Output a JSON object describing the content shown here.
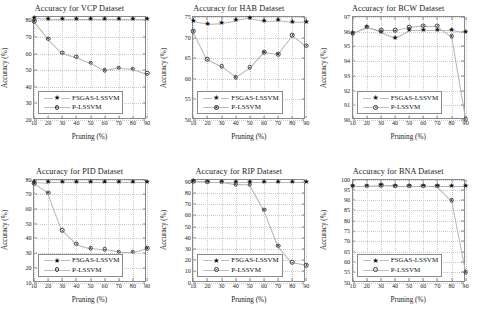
{
  "figure": {
    "series_names": [
      "FSGAS-LSSVM",
      "P-LSSVM"
    ],
    "x_axis_label": "Pruning (%)",
    "y_axis_label": "Accuracy (%)"
  },
  "chart_data": [
    {
      "type": "scatter",
      "title": "Accuracy for VCP Dataset",
      "xlabel": "Pruning (%)",
      "ylabel": "Accuracy (%)",
      "x": [
        10,
        20,
        30,
        40,
        50,
        60,
        70,
        80,
        90
      ],
      "xlim": [
        10,
        90
      ],
      "ylim": [
        20,
        82
      ],
      "xticks": [
        10,
        20,
        30,
        40,
        50,
        60,
        70,
        80,
        90
      ],
      "yticks": [
        20,
        30,
        40,
        50,
        60,
        70,
        80
      ],
      "grid": true,
      "legend_position": "lower-left",
      "series": [
        {
          "name": "FSGAS-LSSVM",
          "marker": "star",
          "values": [
            81.5,
            81.0,
            81.0,
            81.0,
            81.0,
            81.0,
            81.0,
            81.0,
            81.0
          ]
        },
        {
          "name": "P-LSSVM",
          "marker": "circle-dot",
          "values": [
            79.5,
            69.0,
            60.5,
            58.0,
            54.5,
            50.0,
            51.5,
            51.0,
            48.0
          ]
        }
      ]
    },
    {
      "type": "scatter",
      "title": "Accuracy for HAB Dataset",
      "xlabel": "Pruning (%)",
      "ylabel": "Accuracy (%)",
      "x": [
        10,
        20,
        30,
        40,
        50,
        60,
        70,
        80,
        90
      ],
      "xlim": [
        10,
        90
      ],
      "ylim": [
        50,
        75
      ],
      "xticks": [
        10,
        20,
        30,
        40,
        50,
        60,
        70,
        80,
        90
      ],
      "yticks": [
        50,
        55,
        60,
        65,
        70,
        75
      ],
      "grid": true,
      "legend_position": "lower-left",
      "series": [
        {
          "name": "FSGAS-LSSVM",
          "marker": "star",
          "values": [
            74.0,
            73.4,
            73.6,
            74.2,
            74.8,
            74.1,
            74.2,
            73.7,
            73.8
          ]
        },
        {
          "name": "P-LSSVM",
          "marker": "circle-dot",
          "values": [
            71.6,
            64.7,
            63.0,
            60.4,
            62.8,
            66.5,
            66.0,
            70.6,
            68.0
          ]
        }
      ]
    },
    {
      "type": "scatter",
      "title": "Accuracy for BCW Dataset",
      "xlabel": "Pruning (%)",
      "ylabel": "Accuracy (%)",
      "x": [
        10,
        20,
        30,
        40,
        50,
        60,
        70,
        80,
        90
      ],
      "xlim": [
        10,
        90
      ],
      "ylim": [
        90,
        97
      ],
      "xticks": [
        10,
        20,
        30,
        40,
        50,
        60,
        70,
        80,
        90
      ],
      "yticks": [
        90,
        91,
        92,
        93,
        94,
        95,
        96,
        97
      ],
      "grid": true,
      "legend_position": "lower-left",
      "series": [
        {
          "name": "FSGAS-LSSVM",
          "marker": "star",
          "values": [
            95.9,
            96.3,
            96.0,
            95.6,
            96.1,
            96.1,
            96.1,
            96.1,
            95.95
          ]
        },
        {
          "name": "P-LSSVM",
          "marker": "circle-dot",
          "values": [
            95.9,
            96.35,
            96.1,
            96.1,
            96.3,
            96.4,
            96.4,
            95.7,
            90.05
          ]
        }
      ]
    },
    {
      "type": "scatter",
      "title": "Accuracy for PID Dataset",
      "xlabel": "Pruning (%)",
      "ylabel": "Accuracy (%)",
      "x": [
        10,
        20,
        30,
        40,
        50,
        60,
        70,
        80,
        90
      ],
      "xlim": [
        10,
        90
      ],
      "ylim": [
        10,
        80
      ],
      "xticks": [
        10,
        20,
        30,
        40,
        50,
        60,
        70,
        80,
        90
      ],
      "yticks": [
        10,
        20,
        30,
        40,
        50,
        60,
        70,
        80
      ],
      "grid": true,
      "legend_position": "lower-left",
      "series": [
        {
          "name": "FSGAS-LSSVM",
          "marker": "star",
          "values": [
            78.5,
            78.0,
            78.0,
            78.0,
            78.0,
            78.0,
            78.0,
            78.0,
            78.0
          ]
        },
        {
          "name": "P-LSSVM",
          "marker": "circle-dot",
          "values": [
            77.5,
            71.0,
            45.5,
            36.5,
            33.5,
            32.5,
            31.0,
            31.0,
            33.5
          ]
        }
      ]
    },
    {
      "type": "scatter",
      "title": "Accuracy for RIP Dataset",
      "xlabel": "Pruning (%)",
      "ylabel": "Accuracy (%)",
      "x": [
        10,
        20,
        30,
        40,
        50,
        60,
        70,
        80,
        90
      ],
      "xlim": [
        10,
        90
      ],
      "ylim": [
        0,
        92
      ],
      "xticks": [
        10,
        20,
        30,
        40,
        50,
        60,
        70,
        80,
        90
      ],
      "yticks": [
        0,
        10,
        20,
        30,
        40,
        50,
        60,
        70,
        80,
        90
      ],
      "grid": true,
      "legend_position": "lower-left",
      "series": [
        {
          "name": "FSGAS-LSSVM",
          "marker": "star",
          "values": [
            90.5,
            90.0,
            90.0,
            90.0,
            90.0,
            90.0,
            90.0,
            90.0,
            90.0
          ]
        },
        {
          "name": "P-LSSVM",
          "marker": "circle-dot",
          "values": [
            90.5,
            90.0,
            90.0,
            88.0,
            87.5,
            65.0,
            33.0,
            18.0,
            15.5
          ]
        }
      ]
    },
    {
      "type": "scatter",
      "title": "Accuracy for BNA Dataset",
      "xlabel": "Pruning (%)",
      "ylabel": "Accuracy (%)",
      "x": [
        10,
        20,
        30,
        40,
        50,
        60,
        70,
        80,
        90
      ],
      "xlim": [
        10,
        90
      ],
      "ylim": [
        50,
        100
      ],
      "xticks": [
        10,
        20,
        30,
        40,
        50,
        60,
        70,
        80,
        90
      ],
      "yticks": [
        50,
        55,
        60,
        65,
        70,
        75,
        80,
        85,
        90,
        95,
        100
      ],
      "grid": true,
      "legend_position": "lower-left",
      "series": [
        {
          "name": "FSGAS-LSSVM",
          "marker": "star",
          "values": [
            97.0,
            97.0,
            97.2,
            97.0,
            97.0,
            97.0,
            97.0,
            97.0,
            97.0
          ]
        },
        {
          "name": "P-LSSVM",
          "marker": "circle-dot",
          "values": [
            97.0,
            97.0,
            97.2,
            97.0,
            97.0,
            97.0,
            97.0,
            90.0,
            55.0
          ]
        }
      ]
    }
  ]
}
